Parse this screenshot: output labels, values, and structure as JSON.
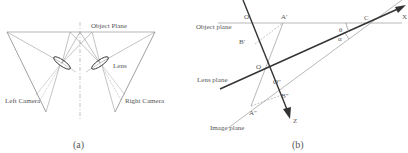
{
  "panel_a": {
    "caption": "(a)",
    "labels": {
      "object_plane": "Object Plane",
      "lens": "Lens",
      "left_camera": "Left Camera",
      "right_camera": "Right Camera"
    }
  },
  "panel_b": {
    "caption": "(b)",
    "labels": {
      "object_plane": "Object plane",
      "lens_plane": "Lens plane",
      "image_plane": "Image plane",
      "axis_x": "X",
      "axis_z": "Z",
      "point_o": "O",
      "point_o_prime": "O′",
      "point_o_double_prime": "O″",
      "point_a_prime": "A′",
      "point_a_double_prime": "A″",
      "point_b_prime": "B′",
      "point_b_double_prime": "B″",
      "point_c": "C",
      "angle_theta": "θ",
      "angle_alpha": "α"
    }
  },
  "colors": {
    "thin_line": "#9a9a9a",
    "thick_line": "#333333",
    "text": "#555555"
  }
}
